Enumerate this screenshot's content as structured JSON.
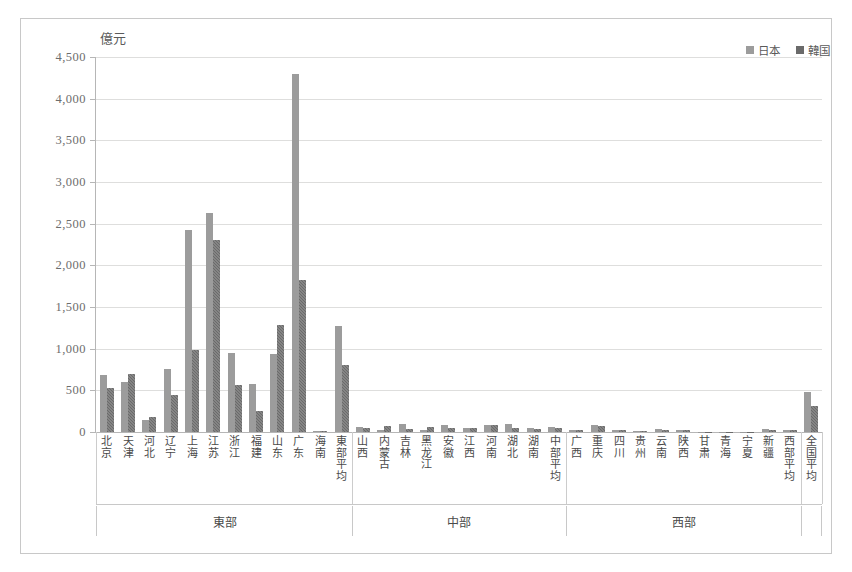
{
  "chart_data": {
    "type": "bar",
    "title": "",
    "subtitle": "",
    "unit_label": "億元",
    "ylabel": "億元",
    "xlabel": "",
    "ylim": [
      0,
      4500
    ],
    "ytick_step": 500,
    "ytick_labels": [
      "4,500",
      "4,000",
      "3,500",
      "3,000",
      "2,500",
      "2,000",
      "1,500",
      "1,000",
      "500",
      "0"
    ],
    "ytick_values": [
      4500,
      4000,
      3500,
      3000,
      2500,
      2000,
      1500,
      1000,
      500,
      0
    ],
    "grid": true,
    "legend_position": "top-right",
    "legend": [
      "日本",
      "韓国"
    ],
    "categories": [
      "北京",
      "天津",
      "河北",
      "辽宁",
      "上海",
      "江苏",
      "浙江",
      "福建",
      "山东",
      "广东",
      "海南",
      "東部平均",
      "山西",
      "内蒙古",
      "吉林",
      "黑龙江",
      "安徽",
      "江西",
      "河南",
      "湖北",
      "湖南",
      "中部平均",
      "广西",
      "重庆",
      "四川",
      "贵州",
      "云南",
      "陕西",
      "甘肃",
      "青海",
      "宁夏",
      "新疆",
      "西部平均",
      "全国平均"
    ],
    "series": [
      {
        "name": "日本",
        "color": "#9c9c9c",
        "values": [
          680,
          600,
          150,
          760,
          2420,
          2630,
          950,
          580,
          940,
          4300,
          10,
          1270,
          55,
          30,
          95,
          30,
          85,
          50,
          80,
          95,
          45,
          55,
          25,
          85,
          20,
          10,
          35,
          30,
          5,
          3,
          5,
          35,
          30,
          480
        ]
      },
      {
        "name": "韓国",
        "color": "#6a6a6a",
        "values": [
          530,
          700,
          180,
          450,
          980,
          2300,
          570,
          250,
          1290,
          1830,
          8,
          810,
          45,
          70,
          40,
          60,
          50,
          45,
          90,
          50,
          35,
          45,
          20,
          75,
          30,
          8,
          25,
          25,
          4,
          2,
          4,
          25,
          22,
          310
        ]
      }
    ],
    "regions": [
      {
        "label": "東部",
        "count": 12
      },
      {
        "label": "中部",
        "count": 10
      },
      {
        "label": "西部",
        "count": 11
      },
      {
        "label": "",
        "count": 1
      }
    ]
  }
}
